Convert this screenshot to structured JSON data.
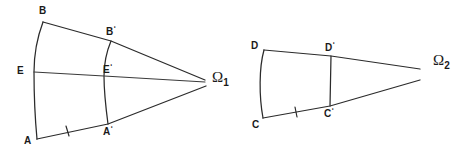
{
  "figure": {
    "background_color": "#ffffff",
    "line_color": "#2b2b2b",
    "width": 465,
    "height": 151
  },
  "left_figure": {
    "name": "asymptotic-figure-omega-1",
    "ideal_point": {
      "symbol": "Ω",
      "subscript": "1",
      "x": 212,
      "y": 74
    },
    "vertices": [
      {
        "id": "B",
        "label": "B",
        "prime": false,
        "x": 43,
        "y": 22,
        "label_x": 39,
        "label_y": 6
      },
      {
        "id": "E",
        "label": "E",
        "prime": false,
        "x": 34,
        "y": 72,
        "label_x": 17,
        "label_y": 66
      },
      {
        "id": "A",
        "label": "A",
        "prime": false,
        "x": 37,
        "y": 139,
        "label_x": 24,
        "label_y": 136
      },
      {
        "id": "Bp",
        "label": "B",
        "prime": true,
        "x": 111,
        "y": 41,
        "label_x": 106,
        "label_y": 25
      },
      {
        "id": "Ep",
        "label": "E",
        "prime": true,
        "x": 104,
        "y": 76,
        "label_x": 103,
        "label_y": 63
      },
      {
        "id": "Ap",
        "label": "A",
        "prime": true,
        "x": 108,
        "y": 124,
        "label_x": 103,
        "label_y": 125
      }
    ],
    "tick_marks": [
      {
        "on_segment": "A-A'",
        "x": 67,
        "y": 131,
        "count": 1
      }
    ]
  },
  "right_figure": {
    "name": "asymptotic-figure-omega-2",
    "ideal_point": {
      "symbol": "Ω",
      "subscript": "2",
      "x": 433,
      "y": 57
    },
    "vertices": [
      {
        "id": "D",
        "label": "D",
        "prime": false,
        "x": 264,
        "y": 50,
        "label_x": 251,
        "label_y": 41
      },
      {
        "id": "C",
        "label": "C",
        "prime": false,
        "x": 263,
        "y": 118,
        "label_x": 252,
        "label_y": 120
      },
      {
        "id": "Dp",
        "label": "D",
        "prime": true,
        "x": 331,
        "y": 56,
        "label_x": 325,
        "label_y": 41
      },
      {
        "id": "Cp",
        "label": "C",
        "prime": true,
        "x": 330,
        "y": 106,
        "label_x": 324,
        "label_y": 107
      }
    ],
    "tick_marks": [
      {
        "on_segment": "C-C'",
        "x": 296,
        "y": 112,
        "count": 1
      }
    ]
  }
}
